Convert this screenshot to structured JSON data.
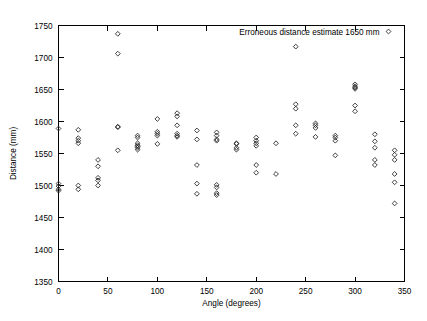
{
  "chart_data": {
    "type": "scatter",
    "title": "",
    "xlabel": "Angle (degrees)",
    "ylabel": "Distance (mm)",
    "xlim": [
      0,
      350
    ],
    "ylim": [
      1350,
      1750
    ],
    "xticks": [
      0,
      50,
      100,
      150,
      200,
      250,
      300,
      350
    ],
    "yticks": [
      1350,
      1400,
      1450,
      1500,
      1550,
      1600,
      1650,
      1700,
      1750
    ],
    "grid": false,
    "legend": {
      "position": "top-right-inside",
      "entries": [
        {
          "label": "Erroneous distance estimate 1650 mm",
          "marker": "diamond-open"
        }
      ]
    },
    "series": [
      {
        "name": "Erroneous distance estimate 1650 mm",
        "marker": "diamond-open",
        "color": "#2a2a2a",
        "points": [
          [
            0,
            1589
          ],
          [
            0,
            1503
          ],
          [
            0,
            1499
          ],
          [
            0,
            1494
          ],
          [
            0,
            1492
          ],
          [
            20,
            1587
          ],
          [
            20,
            1574
          ],
          [
            20,
            1570
          ],
          [
            20,
            1566
          ],
          [
            20,
            1500
          ],
          [
            20,
            1494
          ],
          [
            40,
            1540
          ],
          [
            40,
            1530
          ],
          [
            40,
            1512
          ],
          [
            40,
            1508
          ],
          [
            40,
            1500
          ],
          [
            60,
            1737
          ],
          [
            60,
            1706
          ],
          [
            60,
            1592
          ],
          [
            60,
            1591
          ],
          [
            60,
            1555
          ],
          [
            80,
            1578
          ],
          [
            80,
            1575
          ],
          [
            80,
            1566
          ],
          [
            80,
            1563
          ],
          [
            80,
            1561
          ],
          [
            80,
            1559
          ],
          [
            80,
            1556
          ],
          [
            100,
            1604
          ],
          [
            100,
            1584
          ],
          [
            100,
            1581
          ],
          [
            100,
            1578
          ],
          [
            100,
            1565
          ],
          [
            120,
            1613
          ],
          [
            120,
            1608
          ],
          [
            120,
            1594
          ],
          [
            120,
            1581
          ],
          [
            120,
            1578
          ],
          [
            120,
            1576
          ],
          [
            140,
            1586
          ],
          [
            140,
            1572
          ],
          [
            140,
            1532
          ],
          [
            140,
            1503
          ],
          [
            140,
            1487
          ],
          [
            160,
            1583
          ],
          [
            160,
            1578
          ],
          [
            160,
            1572
          ],
          [
            160,
            1570
          ],
          [
            160,
            1501
          ],
          [
            160,
            1497
          ],
          [
            160,
            1488
          ],
          [
            160,
            1485
          ],
          [
            180,
            1566
          ],
          [
            180,
            1565
          ],
          [
            180,
            1559
          ],
          [
            180,
            1556
          ],
          [
            200,
            1575
          ],
          [
            200,
            1570
          ],
          [
            200,
            1566
          ],
          [
            200,
            1562
          ],
          [
            200,
            1532
          ],
          [
            200,
            1520
          ],
          [
            220,
            1566
          ],
          [
            220,
            1518
          ],
          [
            240,
            1717
          ],
          [
            240,
            1627
          ],
          [
            240,
            1620
          ],
          [
            240,
            1594
          ],
          [
            240,
            1581
          ],
          [
            260,
            1597
          ],
          [
            260,
            1594
          ],
          [
            260,
            1590
          ],
          [
            260,
            1576
          ],
          [
            280,
            1578
          ],
          [
            280,
            1575
          ],
          [
            280,
            1570
          ],
          [
            280,
            1547
          ],
          [
            300,
            1658
          ],
          [
            300,
            1655
          ],
          [
            300,
            1653
          ],
          [
            300,
            1651
          ],
          [
            300,
            1625
          ],
          [
            300,
            1616
          ],
          [
            320,
            1580
          ],
          [
            320,
            1569
          ],
          [
            320,
            1559
          ],
          [
            320,
            1540
          ],
          [
            320,
            1532
          ],
          [
            340,
            1555
          ],
          [
            340,
            1548
          ],
          [
            340,
            1540
          ],
          [
            340,
            1518
          ],
          [
            340,
            1505
          ],
          [
            340,
            1472
          ]
        ]
      }
    ]
  }
}
